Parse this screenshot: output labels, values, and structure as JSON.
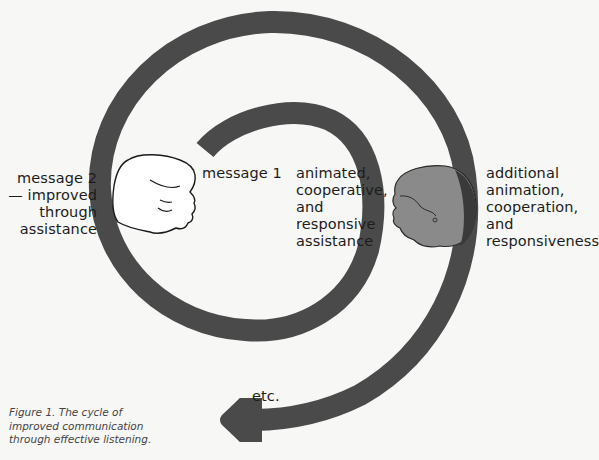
{
  "figure": {
    "caption_lines": [
      "Figure 1.   The cycle of",
      "improved communication",
      "through effective listening."
    ],
    "colors": {
      "spiral": "#4a4a4a",
      "background": "#f7f7f5",
      "listener_head_fill": "#8a8a8a",
      "listener_face_shadow": "#3a3a3a",
      "speaker_head_fill": "#ffffff",
      "outline": "#1a1a1a"
    }
  },
  "labels": {
    "message2": [
      "message 2",
      "— improved",
      "through",
      "assistance"
    ],
    "message1": "message 1",
    "assistance": [
      "animated,",
      "cooperative,",
      "and",
      "responsive",
      "assistance"
    ],
    "additional": [
      "additional",
      "animation,",
      "cooperation,",
      "and",
      "responsiveness"
    ],
    "etc": "etc."
  },
  "icons": {
    "speaker": "speaker-head-outline-icon",
    "listener": "listener-head-shaded-icon",
    "arrow": "arrowhead-left-icon"
  }
}
